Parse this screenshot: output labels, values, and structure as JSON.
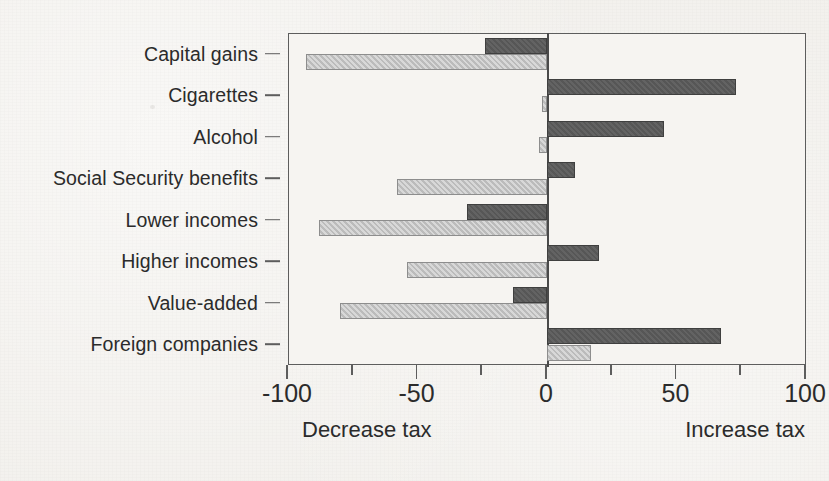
{
  "chart_data": {
    "type": "bar",
    "orientation": "horizontal",
    "title": "",
    "xlabel": "",
    "ylabel": "",
    "xlim": [
      -100,
      100
    ],
    "xticks": [
      -100,
      -50,
      0,
      50,
      100
    ],
    "xtick_labels": [
      "-100",
      "-50",
      "0",
      "50",
      "100"
    ],
    "minor_xticks": [
      -75,
      -25,
      25,
      75
    ],
    "grid": false,
    "legend": "none",
    "zero_reference_line": true,
    "axis_captions": {
      "left": "Decrease tax",
      "right": "Increase tax"
    },
    "categories": [
      "Capital gains",
      "Cigarettes",
      "Alcohol",
      "Social Security benefits",
      "Lower incomes",
      "Higher incomes",
      "Value-added",
      "Foreign companies"
    ],
    "series": [
      {
        "name": "dark",
        "color": "#5b5b5b",
        "values": [
          -24,
          73,
          45,
          11,
          -31,
          20,
          -13,
          67
        ]
      },
      {
        "name": "light",
        "color": "#c3c3c3",
        "values": [
          -93,
          -2,
          -3,
          -58,
          -88,
          -54,
          -80,
          17
        ]
      }
    ]
  },
  "colors": {
    "dark_bar": "#5b5b5b",
    "light_bar": "#c3c3c3",
    "axis": "#5d5d5d",
    "background": "#f2f0ec",
    "text": "#2b2b2b"
  }
}
